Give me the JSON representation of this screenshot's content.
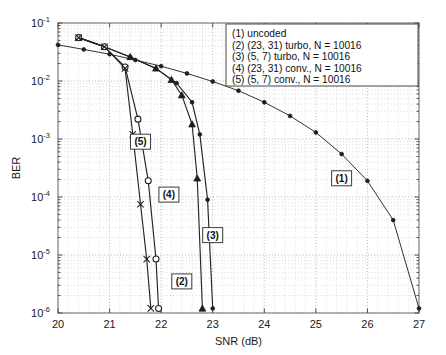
{
  "chart_data": {
    "type": "line",
    "title": "",
    "xlabel": "SNR (dB)",
    "ylabel": "BER",
    "xlim": [
      20,
      27
    ],
    "ylim": [
      1e-06,
      0.1
    ],
    "yscale": "log",
    "grid": true,
    "xticks": [
      20,
      21,
      22,
      23,
      24,
      25,
      26,
      27
    ],
    "xticklabels": [
      "20",
      "21",
      "22",
      "23",
      "24",
      "25",
      "26",
      "27"
    ],
    "yticks": [
      0.1,
      0.01,
      0.001,
      0.0001,
      1e-05,
      1e-06
    ],
    "yticklabels": [
      "10",
      "10",
      "10",
      "10",
      "10",
      "10"
    ],
    "yexponents": [
      "-1",
      "-2",
      "-3",
      "-4",
      "-5",
      "-6"
    ],
    "legend_position": "upper right",
    "series": [
      {
        "name": "(1) uncoded",
        "key": "uncoded",
        "marker": "dot",
        "x": [
          20.0,
          20.5,
          21.0,
          21.5,
          22.0,
          22.5,
          23.0,
          23.5,
          24.0,
          24.5,
          25.0,
          25.5,
          26.0,
          26.5,
          27.0
        ],
        "y": [
          0.042,
          0.035,
          0.029,
          0.023,
          0.018,
          0.0135,
          0.0098,
          0.0068,
          0.0043,
          0.0025,
          0.0013,
          0.00055,
          0.00019,
          4e-05,
          1.2e-06
        ]
      },
      {
        "name": "(2) (23, 31) turbo, N = 10016",
        "key": "turbo_23_31",
        "marker": "triangle",
        "x": [
          20.4,
          20.9,
          21.4,
          21.9,
          22.2,
          22.4,
          22.6,
          22.7,
          22.8
        ],
        "y": [
          0.056,
          0.039,
          0.026,
          0.0165,
          0.0105,
          0.0057,
          0.0018,
          0.00021,
          1.2e-06
        ]
      },
      {
        "name": "(3) (5, 7) turbo, N = 10016",
        "key": "turbo_5_7",
        "marker": "dot",
        "x": [
          20.4,
          20.9,
          21.4,
          21.9,
          22.3,
          22.6,
          22.75,
          22.9,
          23.0
        ],
        "y": [
          0.056,
          0.039,
          0.026,
          0.0165,
          0.0092,
          0.0043,
          0.0012,
          9e-05,
          1.2e-06
        ]
      },
      {
        "name": "(4) (23, 31) conv., N = 10016",
        "key": "conv_23_31",
        "marker": "circle",
        "x": [
          20.4,
          20.9,
          21.3,
          21.55,
          21.75,
          21.9,
          21.95
        ],
        "y": [
          0.056,
          0.039,
          0.0175,
          0.0022,
          0.00019,
          8.5e-06,
          1.2e-06
        ]
      },
      {
        "name": "(5) (5, 7) conv., N = 10016",
        "key": "conv_5_7",
        "marker": "x",
        "x": [
          20.4,
          20.9,
          21.3,
          21.45,
          21.6,
          21.72,
          21.8
        ],
        "y": [
          0.056,
          0.039,
          0.0165,
          0.0012,
          7.5e-05,
          8.5e-06,
          1.2e-06
        ]
      }
    ],
    "annotations": [
      {
        "text": "(1)",
        "x": 25.5,
        "y": 0.00021
      },
      {
        "text": "(2)",
        "x": 22.4,
        "y": 3.5e-06
      },
      {
        "text": "(3)",
        "x": 23.0,
        "y": 2.2e-05
      },
      {
        "text": "(4)",
        "x": 22.15,
        "y": 0.00011
      },
      {
        "text": "(5)",
        "x": 21.6,
        "y": 0.0009
      }
    ]
  },
  "legend": {
    "items": [
      {
        "label": "(1) uncoded"
      },
      {
        "label": "(2) (23, 31) turbo, N = 10016"
      },
      {
        "label": "(3) (5, 7) turbo, N = 10016"
      },
      {
        "label": "(4) (23, 31) conv., N = 10016"
      },
      {
        "label": "(5) (5, 7) conv., N = 10016"
      }
    ]
  },
  "axes": {
    "x_title": "SNR (dB)",
    "y_title": "BER"
  }
}
